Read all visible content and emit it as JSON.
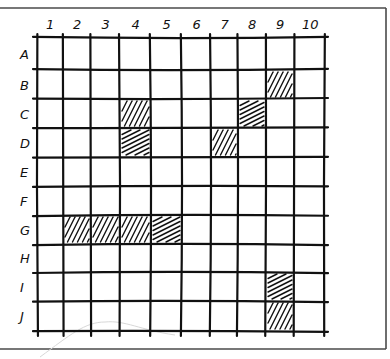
{
  "grid": {
    "columns": [
      "1",
      "2",
      "3",
      "4",
      "5",
      "6",
      "7",
      "8",
      "9",
      "10"
    ],
    "rows": [
      "A",
      "B",
      "C",
      "D",
      "E",
      "F",
      "G",
      "H",
      "I",
      "J"
    ],
    "column_lines_x": [
      37,
      63,
      91,
      120,
      151,
      182,
      211,
      238,
      266,
      294,
      324
    ],
    "row_lines_y": [
      38,
      70,
      99,
      128,
      157,
      186,
      215,
      244,
      272,
      301,
      331
    ],
    "line_color": "#111111",
    "hatch_color": "#111111",
    "frame_color": "#4a4a4a"
  },
  "shaded_cells": [
    {
      "cell": "B9",
      "row": 1,
      "col": 8,
      "hatch": "steep"
    },
    {
      "cell": "C4",
      "row": 2,
      "col": 3,
      "hatch": "steep"
    },
    {
      "cell": "C8",
      "row": 2,
      "col": 7,
      "hatch": "shallow"
    },
    {
      "cell": "D4",
      "row": 3,
      "col": 3,
      "hatch": "shallow"
    },
    {
      "cell": "D7",
      "row": 3,
      "col": 6,
      "hatch": "steep"
    },
    {
      "cell": "G2",
      "row": 6,
      "col": 1,
      "hatch": "steep"
    },
    {
      "cell": "G3",
      "row": 6,
      "col": 2,
      "hatch": "steep"
    },
    {
      "cell": "G4",
      "row": 6,
      "col": 3,
      "hatch": "steep"
    },
    {
      "cell": "G5",
      "row": 6,
      "col": 4,
      "hatch": "shallow"
    },
    {
      "cell": "I9",
      "row": 8,
      "col": 8,
      "hatch": "shallow"
    },
    {
      "cell": "J9",
      "row": 9,
      "col": 8,
      "hatch": "steep"
    }
  ]
}
